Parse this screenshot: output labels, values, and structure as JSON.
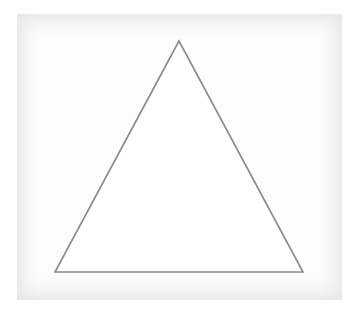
{
  "diagram": {
    "shape": "triangle",
    "vertices": [
      {
        "x": 179,
        "y": 41
      },
      {
        "x": 55,
        "y": 272
      },
      {
        "x": 303,
        "y": 272
      }
    ],
    "stroke_color": "#8a8a8a",
    "fill_color": "#ffffff"
  }
}
